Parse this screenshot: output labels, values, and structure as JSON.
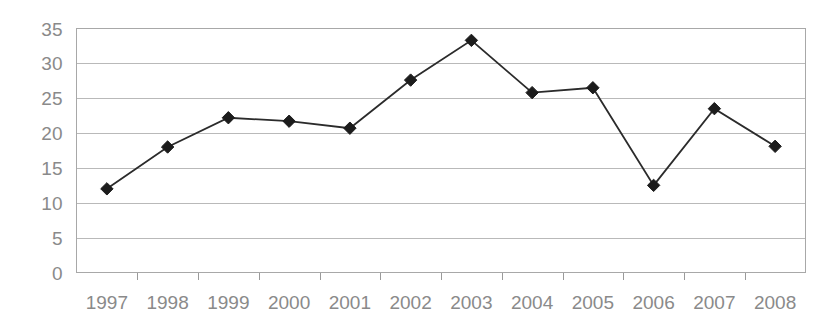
{
  "chart_data": {
    "type": "line",
    "title": "",
    "subtitle": "",
    "xlabel": "",
    "ylabel": "",
    "categories": [
      "1997",
      "1998",
      "1999",
      "2000",
      "2001",
      "2002",
      "2003",
      "2004",
      "2005",
      "2006",
      "2007",
      "2008"
    ],
    "values": [
      12.0,
      18.0,
      22.2,
      21.7,
      20.7,
      27.6,
      33.3,
      25.8,
      26.5,
      12.5,
      23.5,
      18.1
    ],
    "series": [
      {
        "name": "series-1",
        "values": [
          12.0,
          18.0,
          22.2,
          21.7,
          20.7,
          27.6,
          33.3,
          25.8,
          26.5,
          12.5,
          23.5,
          18.1
        ]
      }
    ],
    "ylim": [
      0,
      35
    ],
    "ytick_labels": [
      "0",
      "5",
      "10",
      "15",
      "20",
      "25",
      "30",
      "35"
    ],
    "ytick_values": [
      0,
      5,
      10,
      15,
      20,
      25,
      30,
      35
    ],
    "xtick_labels": [
      "1997",
      "1998",
      "1999",
      "2000",
      "2001",
      "2002",
      "2003",
      "2004",
      "2005",
      "2006",
      "2007",
      "2008"
    ],
    "grid": true,
    "grid_axis": "y",
    "legend": false,
    "legend_position": "none",
    "marker": "diamond",
    "annotations": []
  },
  "style": {
    "background_color": "#ffffff",
    "line_color": "#2b2b2b",
    "marker_color": "#1c1c1c",
    "gridline_color": "#b9b9b9",
    "frame_color": "#a8a8a8",
    "tick_label_color": "#8a8a8a"
  }
}
